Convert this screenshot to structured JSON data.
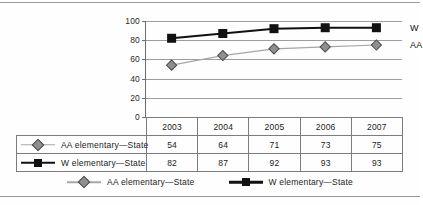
{
  "chart_data": {
    "type": "line",
    "title": "",
    "xlabel": "",
    "ylabel": "",
    "categories": [
      "2003",
      "2004",
      "2005",
      "2006",
      "2007"
    ],
    "ylim": [
      0,
      100
    ],
    "yticks": [
      0,
      20,
      40,
      60,
      80,
      100
    ],
    "grid": true,
    "legend_position": "bottom",
    "series": [
      {
        "name": "AA elementary—State",
        "short_label": "AA",
        "values": [
          54,
          64,
          71,
          73,
          75
        ],
        "color": "#a6a6a6",
        "marker": "diamond",
        "marker_color": "#8f8f8f"
      },
      {
        "name": "W elementary—State",
        "short_label": "W",
        "values": [
          82,
          87,
          92,
          93,
          93
        ],
        "color": "#111111",
        "marker": "square",
        "marker_color": "#111111"
      }
    ],
    "table": {
      "header": [
        "",
        "2003",
        "2004",
        "2005",
        "2006",
        "2007"
      ],
      "rows": [
        {
          "label": "AA elementary—State",
          "values": [
            "54",
            "64",
            "71",
            "73",
            "75"
          ]
        },
        {
          "label": "W elementary—State",
          "values": [
            "82",
            "87",
            "92",
            "93",
            "93"
          ]
        }
      ]
    },
    "annotations": [
      {
        "text": "W",
        "series": "W elementary—State"
      },
      {
        "text": "AA",
        "series": "AA elementary—State"
      }
    ]
  }
}
